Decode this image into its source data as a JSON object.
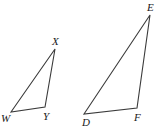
{
  "figure": {
    "background_color": "#ffffff",
    "stroke_color": "#3a3a3a",
    "label_color": "#1a1a1a",
    "stroke_width": 1.1,
    "width": 158,
    "height": 135
  },
  "triangles": [
    {
      "id": "triangle-wxy",
      "name": "triangle-WXY",
      "vertices": [
        {
          "label": "W",
          "x": 11,
          "y": 112,
          "label_x": 1,
          "label_y": 113
        },
        {
          "label": "X",
          "x": 55,
          "y": 49,
          "label_x": 52,
          "label_y": 36
        },
        {
          "label": "Y",
          "x": 45,
          "y": 107,
          "label_x": 43,
          "label_y": 111
        }
      ],
      "edges": [
        {
          "name": "edge-WX",
          "from": "W",
          "to": "X"
        },
        {
          "name": "edge-XY",
          "from": "X",
          "to": "Y"
        },
        {
          "name": "edge-YW",
          "from": "Y",
          "to": "W"
        }
      ]
    },
    {
      "id": "triangle-def",
      "name": "triangle-DEF",
      "vertices": [
        {
          "label": "D",
          "x": 84,
          "y": 114,
          "label_x": 82,
          "label_y": 117
        },
        {
          "label": "E",
          "x": 150,
          "y": 15,
          "label_x": 147,
          "label_y": 2
        },
        {
          "label": "F",
          "x": 137,
          "y": 108,
          "label_x": 134,
          "label_y": 112
        }
      ],
      "edges": [
        {
          "name": "edge-DE",
          "from": "D",
          "to": "E"
        },
        {
          "name": "edge-EF",
          "from": "E",
          "to": "F"
        },
        {
          "name": "edge-FD",
          "from": "F",
          "to": "D"
        }
      ]
    }
  ]
}
